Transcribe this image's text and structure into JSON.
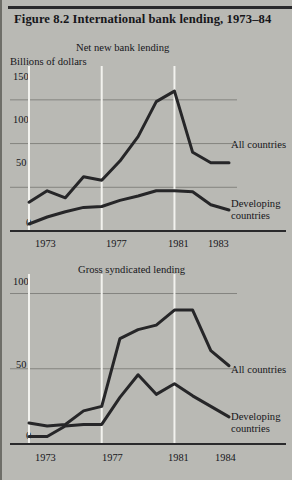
{
  "figure": {
    "number_label": "Figure 8.2",
    "title": "International bank lending, 1973–84",
    "full_title": "Figure 8.2    International bank lending, 1973–84",
    "background_color": "#b9b9b4",
    "line_color": "#262628",
    "gridline_color_horizontal": "#84847f",
    "gridline_color_vertical": "#f2f2ee",
    "axis_color": "#2a2a2c"
  },
  "chart_data": [
    {
      "type": "line",
      "title": "Net new bank lending",
      "subtitle": "Net new bank lending",
      "ylabel": "Billions of dollars",
      "xlabel": "",
      "ylim": [
        0,
        175
      ],
      "yticks": [
        0,
        50,
        100,
        150
      ],
      "ytick_labels": [
        "0",
        "50",
        "100",
        "150"
      ],
      "xlim": [
        1973,
        1984
      ],
      "xticks": [
        1973,
        1977,
        1981,
        1983
      ],
      "xtick_labels": [
        "1973",
        "1977",
        "1981",
        "1983"
      ],
      "gridlines_horizontal": true,
      "gridlines_vertical": true,
      "legend_position": "right-inline",
      "x": [
        1973,
        1974,
        1975,
        1976,
        1977,
        1978,
        1979,
        1980,
        1981,
        1982,
        1983,
        1984
      ],
      "series": [
        {
          "name": "All countries",
          "label": "All countries",
          "values": [
            33,
            46,
            38,
            62,
            58,
            80,
            108,
            148,
            160,
            90,
            78,
            78
          ]
        },
        {
          "name": "Developing countries",
          "label": "Developing countries",
          "label_line1": "Developing",
          "label_line2": "countries",
          "values": [
            8,
            16,
            22,
            27,
            28,
            35,
            40,
            46,
            46,
            45,
            30,
            24
          ]
        }
      ]
    },
    {
      "type": "line",
      "title": "Gross syndicated lending",
      "subtitle": "Gross syndicated lending",
      "ylabel": "",
      "xlabel": "",
      "ylim": [
        0,
        105
      ],
      "yticks": [
        0,
        50,
        100
      ],
      "ytick_labels": [
        "0",
        "50",
        "100"
      ],
      "xlim": [
        1973,
        1984
      ],
      "xticks": [
        1973,
        1977,
        1981,
        1984
      ],
      "xtick_labels": [
        "1973",
        "1977",
        "1981",
        "1984"
      ],
      "gridlines_horizontal": true,
      "gridlines_vertical": true,
      "legend_position": "right-inline",
      "x": [
        1973,
        1974,
        1975,
        1976,
        1977,
        1978,
        1979,
        1980,
        1981,
        1982,
        1983,
        1984
      ],
      "series": [
        {
          "name": "All countries",
          "label": "All countries",
          "values": [
            14,
            12,
            13,
            22,
            25,
            70,
            76,
            79,
            89,
            89,
            62,
            52
          ]
        },
        {
          "name": "Developing countries",
          "label": "Developing countries",
          "label_line1": "Developing",
          "label_line2": "countries",
          "values": [
            5,
            5,
            12,
            13,
            13,
            31,
            46,
            33,
            40,
            32,
            25,
            18
          ]
        }
      ]
    }
  ]
}
